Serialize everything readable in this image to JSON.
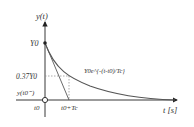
{
  "figure": {
    "type": "exponential-decay-diagram",
    "y_axis_label": "y(t)",
    "x_axis_label": "t [s]",
    "labels": {
      "y0": "Y0",
      "y037": "0.37Y0",
      "y_t0_minus": "y(t0⁻)",
      "t0": "t0",
      "t0_plus_tc": "t0+Tc",
      "curve_eq": "Y0e^{-(t-t0)/Tc}"
    },
    "colors": {
      "axis": "#222222",
      "curve": "#555555",
      "tangent": "#444444",
      "guide": "#888888",
      "text": "#333333"
    }
  }
}
